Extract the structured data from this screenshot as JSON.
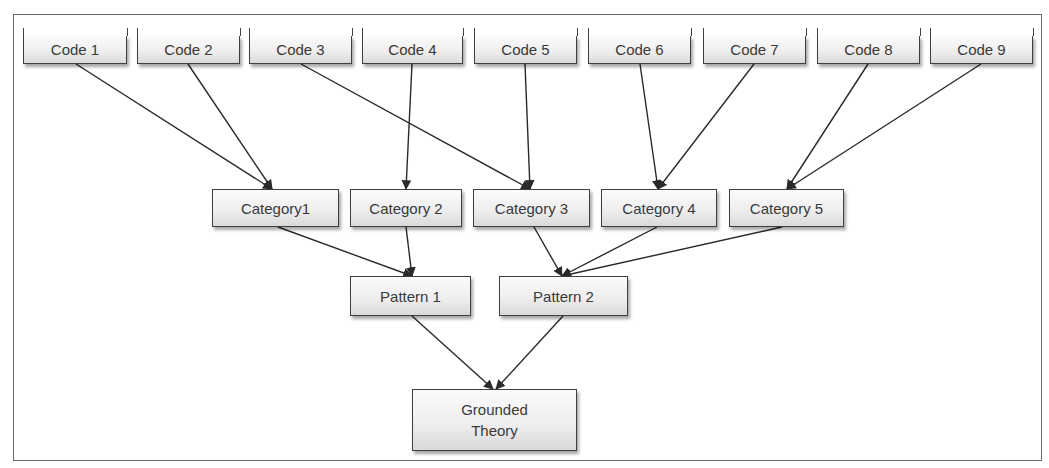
{
  "diagram": {
    "type": "hierarchy-flow",
    "levels": {
      "codes": [
        {
          "id": "code1",
          "label": "Code 1",
          "x": 23,
          "y": 36,
          "w": 104,
          "h": 28
        },
        {
          "id": "code2",
          "label": "Code 2",
          "x": 137,
          "y": 36,
          "w": 103,
          "h": 28
        },
        {
          "id": "code3",
          "label": "Code 3",
          "x": 249,
          "y": 36,
          "w": 103,
          "h": 28
        },
        {
          "id": "code4",
          "label": "Code 4",
          "x": 362,
          "y": 36,
          "w": 101,
          "h": 28
        },
        {
          "id": "code5",
          "label": "Code 5",
          "x": 474,
          "y": 36,
          "w": 103,
          "h": 28
        },
        {
          "id": "code6",
          "label": "Code 6",
          "x": 588,
          "y": 36,
          "w": 103,
          "h": 28
        },
        {
          "id": "code7",
          "label": "Code 7",
          "x": 703,
          "y": 36,
          "w": 103,
          "h": 28
        },
        {
          "id": "code8",
          "label": "Code 8",
          "x": 817,
          "y": 36,
          "w": 103,
          "h": 28
        },
        {
          "id": "code9",
          "label": "Code 9",
          "x": 930,
          "y": 36,
          "w": 103,
          "h": 28
        }
      ],
      "categories": [
        {
          "id": "cat1",
          "label": "Category1",
          "x": 212,
          "y": 189,
          "w": 127,
          "h": 38
        },
        {
          "id": "cat2",
          "label": "Category 2",
          "x": 350,
          "y": 189,
          "w": 112,
          "h": 38
        },
        {
          "id": "cat3",
          "label": "Category 3",
          "x": 473,
          "y": 189,
          "w": 117,
          "h": 38
        },
        {
          "id": "cat4",
          "label": "Category 4",
          "x": 601,
          "y": 189,
          "w": 116,
          "h": 38
        },
        {
          "id": "cat5",
          "label": "Category 5",
          "x": 729,
          "y": 189,
          "w": 115,
          "h": 38
        }
      ],
      "patterns": [
        {
          "id": "pat1",
          "label": "Pattern 1",
          "x": 350,
          "y": 276,
          "w": 121,
          "h": 40
        },
        {
          "id": "pat2",
          "label": "Pattern 2",
          "x": 499,
          "y": 276,
          "w": 129,
          "h": 40
        }
      ],
      "theory": [
        {
          "id": "gt",
          "label": "Grounded\nTheory",
          "x": 412,
          "y": 389,
          "w": 165,
          "h": 62
        }
      ]
    },
    "edges": [
      {
        "from": "code1",
        "to": "cat1",
        "x1": 76,
        "y1": 64,
        "x2": 272,
        "y2": 189
      },
      {
        "from": "code2",
        "to": "cat1",
        "x1": 188,
        "y1": 64,
        "x2": 272,
        "y2": 189
      },
      {
        "from": "code3",
        "to": "cat3",
        "x1": 301,
        "y1": 64,
        "x2": 530,
        "y2": 189
      },
      {
        "from": "code4",
        "to": "cat2",
        "x1": 412,
        "y1": 64,
        "x2": 406,
        "y2": 189
      },
      {
        "from": "code5",
        "to": "cat3",
        "x1": 525,
        "y1": 64,
        "x2": 530,
        "y2": 189
      },
      {
        "from": "code6",
        "to": "cat4",
        "x1": 640,
        "y1": 64,
        "x2": 658,
        "y2": 189
      },
      {
        "from": "code7",
        "to": "cat4",
        "x1": 754,
        "y1": 64,
        "x2": 658,
        "y2": 189
      },
      {
        "from": "code8",
        "to": "cat5",
        "x1": 868,
        "y1": 64,
        "x2": 787,
        "y2": 189
      },
      {
        "from": "code9",
        "to": "cat5",
        "x1": 981,
        "y1": 64,
        "x2": 787,
        "y2": 189
      },
      {
        "from": "cat1",
        "to": "pat1",
        "x1": 278,
        "y1": 227,
        "x2": 412,
        "y2": 276
      },
      {
        "from": "cat2",
        "to": "pat1",
        "x1": 406,
        "y1": 227,
        "x2": 412,
        "y2": 276
      },
      {
        "from": "cat3",
        "to": "pat2",
        "x1": 534,
        "y1": 227,
        "x2": 562,
        "y2": 276
      },
      {
        "from": "cat4",
        "to": "pat2",
        "x1": 657,
        "y1": 227,
        "x2": 562,
        "y2": 276
      },
      {
        "from": "cat5",
        "to": "pat2",
        "x1": 782,
        "y1": 227,
        "x2": 562,
        "y2": 276
      },
      {
        "from": "pat1",
        "to": "gt",
        "x1": 412,
        "y1": 316,
        "x2": 493,
        "y2": 389
      },
      {
        "from": "pat2",
        "to": "gt",
        "x1": 563,
        "y1": 316,
        "x2": 496,
        "y2": 389
      }
    ],
    "colors": {
      "border": "#3f3f3f",
      "text": "#3a3a3a",
      "edge": "#2a2a2a",
      "frame": "#6a6a6a",
      "fill_top": "#fbfbfb",
      "fill_bottom": "#d9d9d9"
    }
  }
}
